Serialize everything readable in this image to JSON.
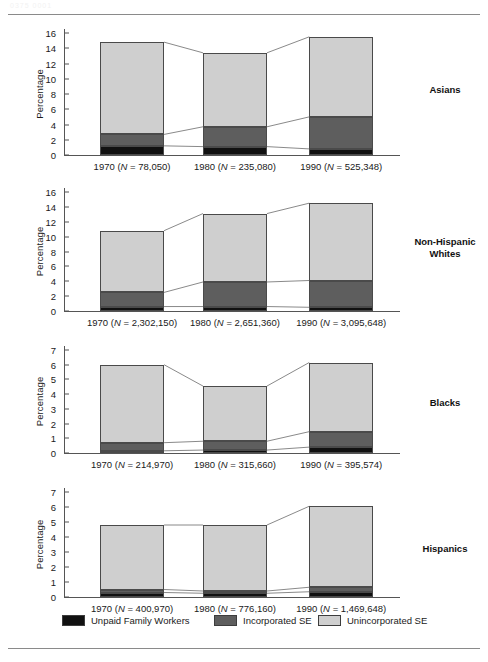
{
  "page": {
    "top_rule": true,
    "bottom_rule": true,
    "faint_header": "0375 0001"
  },
  "colors": {
    "unpaid_family_workers": "#111111",
    "incorporated_se": "#5e5e5e",
    "unincorporated_se": "#cfcfcf",
    "axis": "#555555",
    "text": "#1a1a1a",
    "connector": "#6b6b6b"
  },
  "legend": {
    "items": [
      {
        "label": "Unpaid Family Workers",
        "color": "#111111",
        "key": "unpaid"
      },
      {
        "label": "Incorporated SE",
        "color": "#5e5e5e",
        "key": "incorporated"
      },
      {
        "label": "Unincorporated SE",
        "color": "#cfcfcf",
        "key": "unincorporated"
      }
    ]
  },
  "common": {
    "ylabel": "Percentage",
    "series_names": [
      "Unpaid Family Workers",
      "Incorporated SE",
      "Unincorporated SE"
    ]
  },
  "chart_data": [
    {
      "type": "bar",
      "stacked": true,
      "group": "Asians",
      "title": "Asians",
      "xlabel": "",
      "ylabel": "Percentage",
      "ylim": [
        0,
        16
      ],
      "yticks": [
        0,
        2,
        4,
        6,
        8,
        10,
        12,
        14,
        16
      ],
      "grid": false,
      "categories": [
        "1970",
        "1980",
        "1990"
      ],
      "category_labels": [
        "1970 (N = 78,050)",
        "1980 (N = 235,080)",
        "1990 (N = 525,348)"
      ],
      "n_values": [
        "78,050",
        "235,080",
        "525,348"
      ],
      "series": [
        {
          "name": "Unpaid Family Workers",
          "values": [
            1.2,
            1.1,
            0.8
          ]
        },
        {
          "name": "Incorporated SE",
          "values": [
            1.5,
            2.6,
            4.2
          ]
        },
        {
          "name": "Unincorporated SE",
          "values": [
            12.1,
            9.7,
            10.5
          ]
        }
      ],
      "totals": [
        14.8,
        13.4,
        15.5
      ]
    },
    {
      "type": "bar",
      "stacked": true,
      "group": "Non-Hispanic Whites",
      "title": "Non-Hispanic Whites",
      "title_lines": [
        "Non-Hispanic",
        "Whites"
      ],
      "xlabel": "",
      "ylabel": "Percentage",
      "ylim": [
        0,
        16
      ],
      "yticks": [
        0,
        2,
        4,
        6,
        8,
        10,
        12,
        14,
        16
      ],
      "grid": false,
      "categories": [
        "1970",
        "1980",
        "1990"
      ],
      "category_labels": [
        "1970 (N = 2,302,150)",
        "1980 (N = 2,651,360)",
        "1990 (N = 3,095,648)"
      ],
      "n_values": [
        "2,302,150",
        "2,651,360",
        "3,095,648"
      ],
      "series": [
        {
          "name": "Unpaid Family Workers",
          "values": [
            0.6,
            0.6,
            0.5
          ]
        },
        {
          "name": "Incorporated SE",
          "values": [
            1.9,
            3.3,
            3.6
          ]
        },
        {
          "name": "Unincorporated SE",
          "values": [
            8.3,
            9.2,
            10.4
          ]
        }
      ],
      "totals": [
        10.8,
        13.1,
        14.5
      ]
    },
    {
      "type": "bar",
      "stacked": true,
      "group": "Blacks",
      "title": "Blacks",
      "xlabel": "",
      "ylabel": "Percentage",
      "ylim": [
        0,
        7
      ],
      "yticks": [
        0,
        1,
        2,
        3,
        4,
        5,
        6,
        7
      ],
      "grid": false,
      "categories": [
        "1970",
        "1980",
        "1990"
      ],
      "category_labels": [
        "1970 (N = 214,970)",
        "1980 (N = 315,660)",
        "1990 (N = 395,574)"
      ],
      "n_values": [
        "214,970",
        "315,660",
        "395,574"
      ],
      "series": [
        {
          "name": "Unpaid Family Workers",
          "values": [
            0.15,
            0.2,
            0.4
          ]
        },
        {
          "name": "Incorporated SE",
          "values": [
            0.55,
            0.6,
            1.05
          ]
        },
        {
          "name": "Unincorporated SE",
          "values": [
            5.3,
            3.75,
            4.7
          ]
        }
      ],
      "totals": [
        6.0,
        4.55,
        6.15
      ]
    },
    {
      "type": "bar",
      "stacked": true,
      "group": "Hispanics",
      "title": "Hispanics",
      "xlabel": "",
      "ylabel": "Percentage",
      "ylim": [
        0,
        7
      ],
      "yticks": [
        0,
        1,
        2,
        3,
        4,
        5,
        6,
        7
      ],
      "grid": false,
      "categories": [
        "1970",
        "1980",
        "1990"
      ],
      "category_labels": [
        "1970 (N = 400,970)",
        "1980 (N = 776,160)",
        "1990 (N = 1,469,648)"
      ],
      "n_values": [
        "400,970",
        "776,160",
        "1,469,648"
      ],
      "series": [
        {
          "name": "Unpaid Family Workers",
          "values": [
            0.3,
            0.25,
            0.35
          ]
        },
        {
          "name": "Incorporated SE",
          "values": [
            0.2,
            0.15,
            0.3
          ]
        },
        {
          "name": "Unincorporated SE",
          "values": [
            4.3,
            4.4,
            5.4
          ]
        }
      ],
      "totals": [
        4.8,
        4.8,
        6.05
      ]
    }
  ]
}
